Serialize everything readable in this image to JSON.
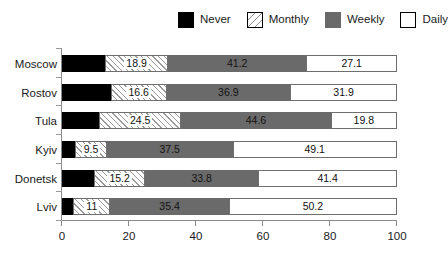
{
  "legend": {
    "position": "top-center",
    "items": [
      {
        "label": "Never",
        "key": "never",
        "color": "#000000",
        "pattern": "solid"
      },
      {
        "label": "Monthly",
        "key": "monthly",
        "color": "#ffffff",
        "pattern": "diagonal-hatch"
      },
      {
        "label": "Weekly",
        "key": "weekly",
        "color": "#6a6a6a",
        "pattern": "solid"
      },
      {
        "label": "Daily",
        "key": "daily",
        "color": "#ffffff",
        "pattern": "solid"
      }
    ]
  },
  "axis": {
    "x_ticks": [
      "0",
      "20",
      "40",
      "60",
      "80",
      "100"
    ],
    "x_tick_values": [
      0,
      20,
      40,
      60,
      80,
      100
    ],
    "y_categories": [
      "Moscow",
      "Rostov",
      "Tula",
      "Kyiv",
      "Donetsk",
      "Lviv"
    ]
  },
  "chart_data": {
    "type": "bar",
    "orientation": "horizontal",
    "stacked": true,
    "stack_total": 100,
    "title": "",
    "subtitle": "",
    "xlabel": "",
    "ylabel": "",
    "xlim": [
      0,
      100
    ],
    "grid": false,
    "legend_position": "top-center",
    "categories": [
      "Moscow",
      "Rostov",
      "Tula",
      "Kyiv",
      "Donetsk",
      "Lviv"
    ],
    "series": [
      {
        "name": "Never",
        "values": [
          12.8,
          14.6,
          11.1,
          3.9,
          9.6,
          3.4
        ],
        "labels_shown": false
      },
      {
        "name": "Monthly",
        "values": [
          18.9,
          16.6,
          24.5,
          9.5,
          15.2,
          11.0
        ],
        "labels_shown": true
      },
      {
        "name": "Weekly",
        "values": [
          41.2,
          36.9,
          44.6,
          37.5,
          33.8,
          35.4
        ],
        "labels_shown": true
      },
      {
        "name": "Daily",
        "values": [
          27.1,
          31.9,
          19.8,
          49.1,
          41.4,
          50.2
        ],
        "labels_shown": true
      }
    ],
    "data_labels": {
      "Moscow": {
        "never": "",
        "monthly": "18.9",
        "weekly": "41.2",
        "daily": "27.1"
      },
      "Rostov": {
        "never": "",
        "monthly": "16.6",
        "weekly": "36.9",
        "daily": "31.9"
      },
      "Tula": {
        "never": "",
        "monthly": "24.5",
        "weekly": "44.6",
        "daily": "19.8"
      },
      "Kyiv": {
        "never": "",
        "monthly": "9.5",
        "weekly": "37.5",
        "daily": "49.1"
      },
      "Donetsk": {
        "never": "",
        "monthly": "15.2",
        "weekly": "33.8",
        "daily": "41.4"
      },
      "Lviv": {
        "never": "",
        "monthly": "11",
        "weekly": "35.4",
        "daily": "50.2"
      }
    }
  },
  "colors": {
    "never": "#000000",
    "monthly": "#ffffff",
    "weekly": "#6a6a6a",
    "daily": "#ffffff",
    "axis": "#8a8a8a",
    "outline": "#6f6f6f",
    "background": "#ffffff",
    "text": "#1a1a1a"
  }
}
